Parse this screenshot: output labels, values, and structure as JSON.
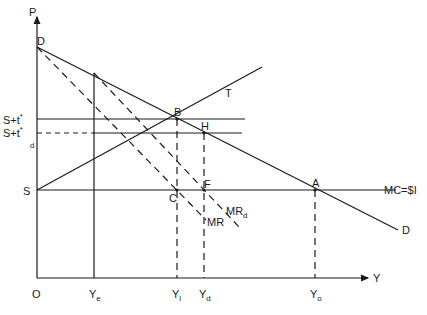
{
  "diagram": {
    "axes": {
      "y_axis_label": "P",
      "x_axis_label": "Y",
      "origin_label": "O"
    },
    "price_labels": {
      "s_t_star": {
        "base": "S+t",
        "sup": "*"
      },
      "s_t_star_d": {
        "base": "S+t",
        "sup": "*",
        "sub": "d"
      },
      "s": "S"
    },
    "quantity_labels": {
      "ye": {
        "base": "Y",
        "sub": "e"
      },
      "y1": {
        "base": "Y",
        "sub": "l"
      },
      "yd": {
        "base": "Y",
        "sub": "d"
      },
      "yo": {
        "base": "Y",
        "sub": "o"
      }
    },
    "curve_labels": {
      "demand_top": "D",
      "demand_end": "D",
      "tariff_line": "T",
      "mc": "MC=$I",
      "mr": "MR",
      "mr_d": {
        "base": "MR",
        "sub": "d"
      }
    },
    "points": {
      "b": "B",
      "h": "H",
      "c": "C",
      "f": "F",
      "a": "A"
    }
  }
}
